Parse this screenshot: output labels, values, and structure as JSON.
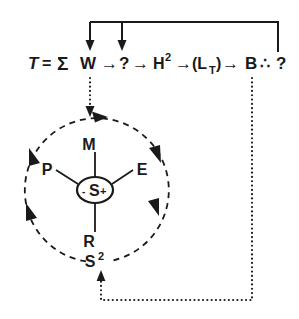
{
  "diagram": {
    "colors": {
      "ink": "#1a1a1a",
      "background": "#ffffff"
    },
    "equation": {
      "name": "top-equation-row",
      "full_text": "T = Σ W → ? → H² →(Lᴛ)→ B ∴ ?",
      "terms": [
        {
          "id": "T",
          "text": "T",
          "style": "italic"
        },
        {
          "id": "equals",
          "text": "="
        },
        {
          "id": "sigma",
          "text": "Σ"
        },
        {
          "id": "W",
          "text": "W"
        },
        {
          "id": "arrow1",
          "text": "→"
        },
        {
          "id": "q1",
          "text": "?"
        },
        {
          "id": "arrow2",
          "text": "→"
        },
        {
          "id": "H2",
          "text": "H",
          "superscript": "2"
        },
        {
          "id": "arrow3",
          "text": "→"
        },
        {
          "id": "LT",
          "text": "(L",
          "subscript": "T",
          "close": ")"
        },
        {
          "id": "arrow4",
          "text": "→"
        },
        {
          "id": "B",
          "text": "B"
        },
        {
          "id": "therefore",
          "text": "∴"
        },
        {
          "id": "q2",
          "text": "?"
        }
      ]
    },
    "circle": {
      "name": "dashed-feedback-circle",
      "center_x": 95,
      "center_y": 189,
      "radius": 72,
      "direction": "clockwise",
      "arrowhead_count": 6,
      "bottom_label": "S",
      "bottom_label_superscript": "2"
    },
    "hub": {
      "name": "hub-node",
      "prefix": "-",
      "letter": "S",
      "suffix": "+",
      "text": "-S+"
    },
    "spokes": [
      {
        "id": "M",
        "label": "M",
        "position": "top"
      },
      {
        "id": "E",
        "label": "E",
        "position": "upper-right"
      },
      {
        "id": "R",
        "label": "R",
        "position": "bottom"
      },
      {
        "id": "P",
        "label": "P",
        "position": "upper-left"
      }
    ],
    "connectors": [
      {
        "id": "top-bracket",
        "name": "top-feedback-bracket",
        "style": "solid",
        "from": "q2",
        "to": [
          "W",
          "q1"
        ],
        "arrowheads": 2
      },
      {
        "id": "w-to-circle",
        "name": "w-to-circle-dotted-arrow",
        "style": "dotted",
        "from": "W",
        "to": "circle-top",
        "arrowheads": 1
      },
      {
        "id": "b-to-s2",
        "name": "b-to-s2-dotted-feedback",
        "style": "dotted",
        "from": "B",
        "to": "S2",
        "arrowheads": 1
      }
    ]
  }
}
